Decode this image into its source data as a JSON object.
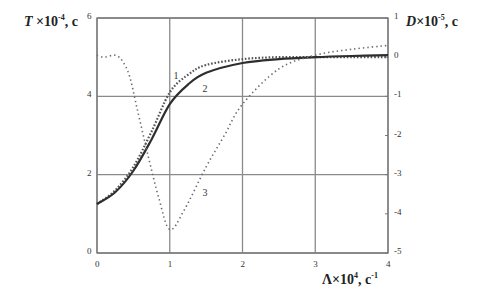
{
  "chart_data": {
    "type": "line",
    "title": "",
    "xlabel": "Λ×10⁴, c⁻¹",
    "ylabel": "T×10⁻⁴, c",
    "ylabel_right": "D×10⁻⁵, c",
    "xlim": [
      0,
      4
    ],
    "ylim": [
      0,
      6
    ],
    "ylim_right": [
      -5,
      1
    ],
    "x_ticks": [
      "0",
      "1",
      "2",
      "3",
      "4"
    ],
    "y_ticks": [
      "0",
      "2",
      "4",
      "6"
    ],
    "y_ticks_right": [
      "1",
      "0",
      "-1",
      "-2",
      "-3",
      "-4",
      "-5"
    ],
    "grid": true,
    "legend": "inline curve labels 1, 2, 3",
    "series": [
      {
        "name": "1",
        "axis": "left",
        "style": "dense-dotted",
        "x": [
          0,
          0.25,
          0.5,
          0.75,
          1.0,
          1.25,
          1.5,
          2.0,
          2.5,
          3.0,
          3.5,
          4.0
        ],
        "values": [
          1.25,
          1.6,
          2.2,
          3.1,
          4.1,
          4.55,
          4.8,
          4.95,
          5.0,
          5.0,
          5.0,
          5.0
        ]
      },
      {
        "name": "2",
        "axis": "left",
        "style": "solid",
        "x": [
          0,
          0.25,
          0.5,
          0.75,
          1.0,
          1.25,
          1.5,
          2.0,
          2.5,
          3.0,
          3.5,
          4.0
        ],
        "values": [
          1.25,
          1.55,
          2.1,
          2.9,
          3.8,
          4.3,
          4.6,
          4.85,
          4.95,
          5.0,
          5.03,
          5.05
        ]
      },
      {
        "name": "3",
        "axis": "right",
        "style": "sparse-dotted",
        "x": [
          0,
          0.1,
          0.25,
          0.35,
          0.45,
          0.55,
          0.7,
          0.85,
          1.0,
          1.2,
          1.5,
          1.75,
          2.0,
          2.5,
          3.0,
          3.5,
          4.0
        ],
        "values": [
          0.05,
          0.0,
          0.05,
          -0.1,
          -0.5,
          -1.3,
          -2.5,
          -3.6,
          -4.4,
          -3.9,
          -2.8,
          -2.0,
          -1.2,
          -0.3,
          0.05,
          0.2,
          0.3
        ]
      }
    ],
    "annotations": [
      {
        "text": "1",
        "x": 1.05,
        "y": 4.45,
        "axis": "left"
      },
      {
        "text": "2",
        "x": 1.45,
        "y": 4.1,
        "axis": "left"
      },
      {
        "text": "3",
        "x": 1.45,
        "y": 1.45,
        "axis": "left"
      }
    ]
  },
  "labels": {
    "left_title_var": "T",
    "left_title_rest": " ×10",
    "left_title_exp": "-4",
    "left_title_unit": ", c",
    "right_title_var": "D",
    "right_title_rest": "×10",
    "right_title_exp": "-5",
    "right_title_unit": ", c",
    "x_title_var": "Λ×10",
    "x_title_exp": "4",
    "x_title_unit": ", c",
    "x_title_unit_exp": "-1"
  },
  "colors": {
    "grid": "#8a8a8a",
    "axis": "#7a7a7a",
    "curve": "#3a3a3a",
    "dotted": "#6a6a6a"
  }
}
